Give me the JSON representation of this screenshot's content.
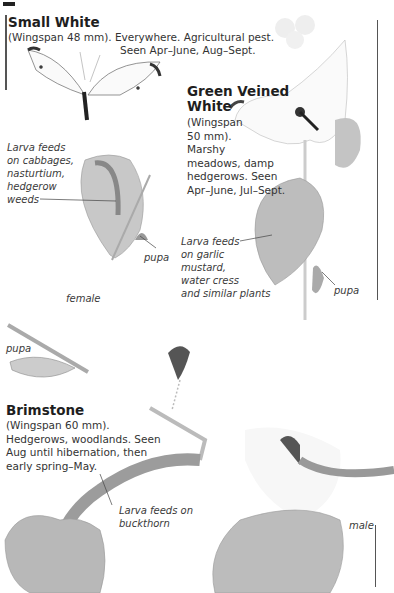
{
  "page": {
    "corner_mark": "",
    "species": [
      {
        "name": "Small White",
        "description_line1": "(Wingspan 48 mm). Everywhere. Agricultural pest.",
        "description_line2": "Seen Apr–June, Aug–Sept.",
        "larva_caption": [
          "Larva feeds",
          "on cabbages,",
          "nasturtium,",
          "hedgerow",
          "weeds"
        ],
        "pupa_label": "pupa",
        "sex_label": "female"
      },
      {
        "name_line1": "Green Veined",
        "name_line2": "White",
        "description": [
          "(Wingspan",
          "50 mm).",
          "Marshy",
          "meadows, damp",
          "hedgerows. Seen",
          "Apr–June, Jul–Sept."
        ],
        "larva_caption": [
          "Larva feeds",
          "on garlic",
          "mustard,",
          "water cress",
          "and similar plants"
        ],
        "pupa_label": "pupa"
      },
      {
        "name": "Brimstone",
        "description": [
          "(Wingspan 60 mm).",
          "Hedgerows, woodlands. Seen",
          "Aug until hibernation, then",
          "early spring–May."
        ],
        "larva_caption": [
          "Larva feeds on",
          "buckthorn"
        ],
        "sex_label": "male",
        "pupa_label": "pupa"
      }
    ]
  },
  "colors": {
    "text": "#2a2a2a",
    "rule": "#555555",
    "leaf": "#b9b9b9",
    "leaf_dark": "#8f8f8f"
  }
}
